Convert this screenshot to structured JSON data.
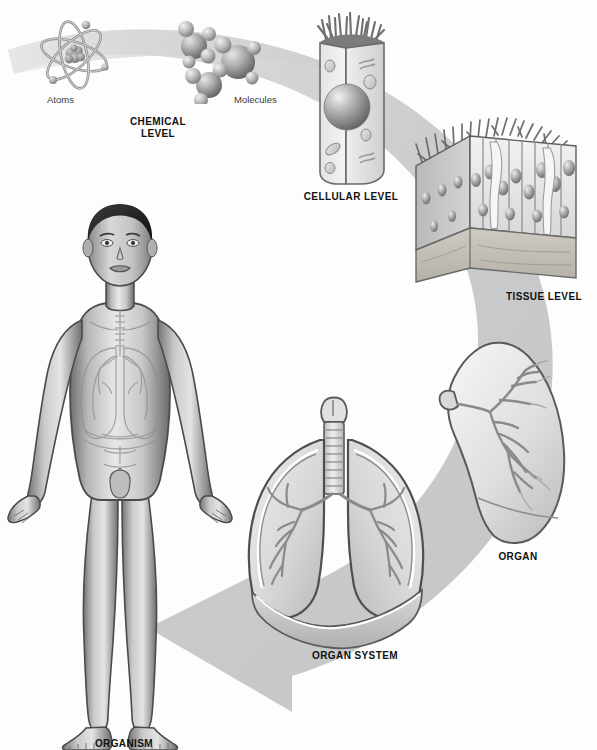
{
  "figure": {
    "background_color": "#fdfdfd",
    "arrow_color": "#c9cacb",
    "ink_color": "#4a4a4a",
    "label_color": "#111111"
  },
  "flow_arrow": {
    "name": "organization-flow-arrow",
    "direction": "clockwise-from-top-left-to-bottom-left",
    "color": "#c9cacb"
  },
  "levels": [
    {
      "id": "chemical",
      "label": "CHEMICAL\nLEVEL",
      "sublabels": [
        {
          "id": "atoms",
          "text": "Atoms"
        },
        {
          "id": "molecules",
          "text": "Molecules"
        }
      ]
    },
    {
      "id": "cellular",
      "label": "CELLULAR LEVEL",
      "sublabels": []
    },
    {
      "id": "tissue",
      "label": "TISSUE LEVEL",
      "sublabels": []
    },
    {
      "id": "organ",
      "label": "ORGAN",
      "sublabels": []
    },
    {
      "id": "organ_system",
      "label": "ORGAN SYSTEM",
      "sublabels": []
    },
    {
      "id": "organism",
      "label": "ORGANISM",
      "sublabels": []
    }
  ],
  "illustrations": {
    "atom": "atom-icon",
    "molecules": "molecules-icon",
    "cell": "columnar-cell-icon",
    "tissue": "epithelial-tissue-block-icon",
    "organ": "lung-icon",
    "organ_system": "respiratory-system-icon",
    "organism": "human-body-icon"
  }
}
